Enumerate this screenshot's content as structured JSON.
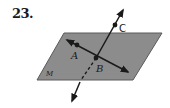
{
  "problem": {
    "number": "23."
  },
  "diagram": {
    "plane": {
      "label": "M",
      "fill": "#8c8c8c",
      "stroke": "#5a5a5a"
    },
    "points": [
      {
        "name": "A",
        "label": "A"
      },
      {
        "name": "B",
        "label": "B"
      },
      {
        "name": "C",
        "label": "C"
      }
    ],
    "lines": [
      {
        "name": "line-AB",
        "through": [
          "A",
          "B"
        ],
        "lies_in_plane": true
      },
      {
        "name": "line-BC",
        "through": [
          "B",
          "C"
        ],
        "intersects_plane_at": "B"
      }
    ],
    "colors": {
      "ink": "#1a1a1a",
      "plane": "#8c8c8c"
    }
  }
}
